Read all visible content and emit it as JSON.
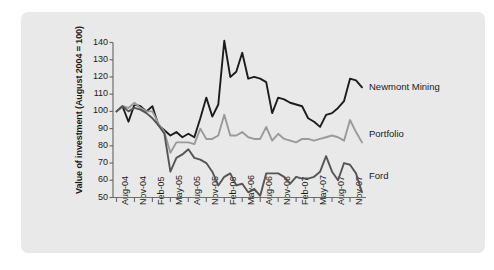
{
  "chart_data": {
    "type": "line",
    "title": "",
    "xlabel": "",
    "ylabel": "Value of investment (August 2004 = 100)",
    "ylim": [
      50,
      140
    ],
    "yticks": [
      50,
      60,
      70,
      80,
      90,
      100,
      110,
      120,
      130,
      140
    ],
    "grid": false,
    "legend_position": "right-inline",
    "x_tick_labels": [
      "Aug-04",
      "Nov-04",
      "Feb-05",
      "May-05",
      "Aug-05",
      "Nov-05",
      "Feb-06",
      "May-06",
      "Aug-06",
      "Nov-06",
      "Feb-07",
      "May-07",
      "Aug-07",
      "Nov-07"
    ],
    "x": [
      "Aug-04",
      "Sep-04",
      "Oct-04",
      "Nov-04",
      "Dec-04",
      "Jan-05",
      "Feb-05",
      "Mar-05",
      "Apr-05",
      "May-05",
      "Jun-05",
      "Jul-05",
      "Aug-05",
      "Sep-05",
      "Oct-05",
      "Nov-05",
      "Dec-05",
      "Jan-06",
      "Feb-06",
      "Mar-06",
      "Apr-06",
      "May-06",
      "Jun-06",
      "Jul-06",
      "Aug-06",
      "Sep-06",
      "Oct-06",
      "Nov-06",
      "Dec-06",
      "Jan-07",
      "Feb-07",
      "Mar-07",
      "Apr-07",
      "May-07",
      "Jun-07",
      "Jul-07",
      "Aug-07",
      "Sep-07",
      "Oct-07",
      "Nov-07",
      "Dec-07",
      "Jan-08"
    ],
    "series": [
      {
        "name": "Newmont Mining",
        "color": "#1c1c1c",
        "values": [
          100,
          103,
          94,
          104,
          103,
          100,
          103,
          92,
          89,
          86,
          88,
          85,
          87,
          85,
          96,
          108,
          97,
          104,
          141,
          120,
          123,
          134,
          119,
          120,
          119,
          117,
          99,
          108,
          107,
          105,
          104,
          103,
          96,
          94,
          91,
          98,
          99,
          102,
          106,
          119,
          118,
          114
        ]
      },
      {
        "name": "Portfolio",
        "color": "#9a9a9a",
        "values": [
          100,
          103,
          102,
          105,
          102,
          100,
          100,
          93,
          88,
          76,
          82,
          82,
          82,
          81,
          90,
          84,
          84,
          86,
          98,
          86,
          86,
          88,
          85,
          84,
          84,
          91,
          83,
          87,
          84,
          83,
          82,
          84,
          84,
          83,
          84,
          85,
          86,
          85,
          83,
          95,
          88,
          82
        ]
      },
      {
        "name": "Ford",
        "color": "#555555",
        "values": [
          100,
          103,
          100,
          102,
          101,
          99,
          96,
          92,
          87,
          65,
          73,
          75,
          78,
          73,
          72,
          70,
          65,
          57,
          62,
          64,
          57,
          58,
          53,
          55,
          51,
          64,
          64,
          64,
          62,
          58,
          62,
          61,
          61,
          62,
          65,
          74,
          65,
          60,
          70,
          69,
          64,
          53
        ]
      }
    ]
  },
  "axis": {
    "y_title": "Value of investment (August 2004 = 100)"
  }
}
